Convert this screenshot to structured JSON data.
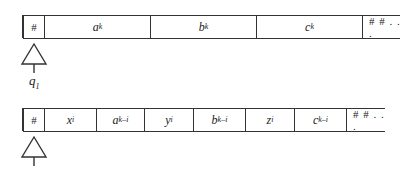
{
  "tape1": {
    "cells": [
      {
        "base": "#",
        "exp": ""
      },
      {
        "base": "a",
        "exp": "k"
      },
      {
        "base": "b",
        "exp": "k"
      },
      {
        "base": "c",
        "exp": "k"
      },
      {
        "base": "# # . . .",
        "exp": ""
      }
    ],
    "head_state": {
      "base": "q",
      "sub": "1"
    }
  },
  "tape2": {
    "cells": [
      {
        "base": "#",
        "exp": ""
      },
      {
        "base": "x",
        "exp": "i"
      },
      {
        "base": "a",
        "exp": "k–i"
      },
      {
        "base": "y",
        "exp": "i"
      },
      {
        "base": "b",
        "exp": "k–i"
      },
      {
        "base": "z",
        "exp": "i"
      },
      {
        "base": "c",
        "exp": "k–i"
      },
      {
        "base": "# # . . .",
        "exp": ""
      }
    ]
  }
}
